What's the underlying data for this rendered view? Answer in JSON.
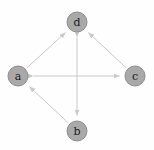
{
  "diagram": {
    "type": "directed-graph",
    "title": "",
    "background_color": "#fefefe",
    "node_fill_color": "#a9a9a9",
    "node_stroke_color": "#8e8e8e",
    "edge_color": "#c9c9c9",
    "label_color": "#1a1a1a",
    "node_radius": 10,
    "nodes": [
      {
        "id": "a",
        "label": "a",
        "x": 18,
        "y": 76
      },
      {
        "id": "b",
        "label": "b",
        "x": 77,
        "y": 131
      },
      {
        "id": "c",
        "label": "c",
        "x": 135,
        "y": 76
      },
      {
        "id": "d",
        "label": "d",
        "x": 77,
        "y": 22
      }
    ],
    "edges": [
      {
        "from": "a",
        "to": "d",
        "directed": true,
        "bidirectional": false
      },
      {
        "from": "c",
        "to": "d",
        "directed": true,
        "bidirectional": false
      },
      {
        "from": "b",
        "to": "a",
        "directed": true,
        "bidirectional": false
      },
      {
        "from": "a",
        "to": "c",
        "directed": true,
        "bidirectional": true
      },
      {
        "from": "d",
        "to": "b",
        "directed": true,
        "bidirectional": true
      }
    ]
  }
}
